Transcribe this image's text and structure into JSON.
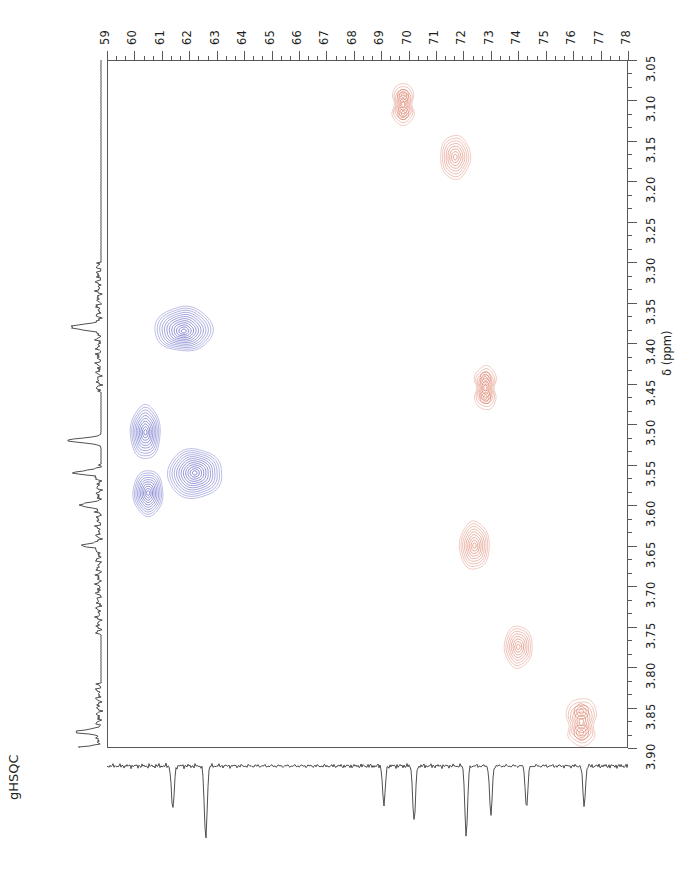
{
  "experiment": {
    "label": "gHSQC",
    "type": "2D HSQC NMR spectrum"
  },
  "axes": {
    "carbon": {
      "position": "top",
      "nucleus": "13C",
      "unit": "ppm",
      "min": 59,
      "max": 78,
      "direction": "increasing-left-to-right",
      "tick_labels": [
        "59",
        "60",
        "61",
        "62",
        "63",
        "64",
        "65",
        "66",
        "67",
        "68",
        "69",
        "70",
        "71",
        "72",
        "73",
        "74",
        "75",
        "76",
        "77",
        "78"
      ],
      "minor_ticks_per_major": 2
    },
    "proton": {
      "position": "right",
      "nucleus": "1H",
      "unit": "ppm",
      "min": 3.05,
      "max": 3.9,
      "direction": "increasing-top-to-bottom",
      "title": "δ (ppm)",
      "tick_labels": [
        "3.05",
        "3.10",
        "3.15",
        "3.20",
        "3.25",
        "3.30",
        "3.35",
        "3.40",
        "3.45",
        "3.50",
        "3.55",
        "3.60",
        "3.65",
        "3.70",
        "3.75",
        "3.80",
        "3.85",
        "3.90"
      ],
      "minor_ticks_per_major": 2
    }
  },
  "colors": {
    "positive_contour": "#d9735a",
    "negative_contour": "#5357bf",
    "axis": "#58585a",
    "trace": "#3c3c3c",
    "background": "#ffffff",
    "text": "#231f20"
  },
  "chart_data": {
    "type": "scatter",
    "title": "",
    "xlabel": "13C δ (ppm)",
    "ylabel": "1H δ (ppm)",
    "xlim": [
      59,
      78
    ],
    "ylim": [
      3.05,
      3.9
    ],
    "grid": false,
    "legend": "none",
    "series": [
      {
        "name": "positive (CH / CH3)",
        "color": "#d9735a",
        "sign": "positive",
        "points": [
          {
            "label": "A",
            "c_ppm": 69.8,
            "h_ppm": 3.105,
            "shape": "split-doublet",
            "rings": 7,
            "w": 26,
            "h": 42
          },
          {
            "label": "B",
            "c_ppm": 71.7,
            "h_ppm": 3.17,
            "shape": "oval",
            "rings": 8,
            "w": 30,
            "h": 44
          },
          {
            "label": "C",
            "c_ppm": 72.8,
            "h_ppm": 3.455,
            "shape": "split-doublet",
            "rings": 7,
            "w": 26,
            "h": 44
          },
          {
            "label": "D",
            "c_ppm": 72.4,
            "h_ppm": 3.65,
            "shape": "oval",
            "rings": 9,
            "w": 30,
            "h": 48
          },
          {
            "label": "E",
            "c_ppm": 74.0,
            "h_ppm": 3.775,
            "shape": "oval",
            "rings": 8,
            "w": 28,
            "h": 42
          },
          {
            "label": "F",
            "c_ppm": 76.3,
            "h_ppm": 3.868,
            "shape": "multi-lobe",
            "rings": 7,
            "w": 34,
            "h": 50
          }
        ]
      },
      {
        "name": "negative (CH2)",
        "color": "#5357bf",
        "sign": "negative",
        "points": [
          {
            "label": "G",
            "c_ppm": 61.8,
            "h_ppm": 3.385,
            "shape": "broad-flat",
            "rings": 12,
            "w": 56,
            "h": 50
          },
          {
            "label": "H",
            "c_ppm": 60.4,
            "h_ppm": 3.51,
            "shape": "oval",
            "rings": 10,
            "w": 30,
            "h": 54
          },
          {
            "label": "I",
            "c_ppm": 62.2,
            "h_ppm": 3.56,
            "shape": "broad-round",
            "rings": 12,
            "w": 54,
            "h": 48
          },
          {
            "label": "J",
            "c_ppm": 60.5,
            "h_ppm": 3.585,
            "shape": "oval",
            "rings": 10,
            "w": 30,
            "h": 46
          }
        ]
      }
    ],
    "projections": {
      "proton_1d": {
        "side": "left",
        "direction": "peaks-point-left",
        "peaks_h_ppm": [
          3.38,
          3.52,
          3.56,
          3.6,
          3.65,
          3.88,
          3.9
        ],
        "noisy_regions": [
          "3.30-3.45",
          "3.55-3.75",
          "3.82-3.90"
        ]
      },
      "carbon_1d": {
        "side": "bottom",
        "direction": "peaks-point-down",
        "peaks_c_ppm": [
          61.4,
          62.6,
          69.1,
          70.2,
          72.1,
          73.0,
          74.3,
          76.4
        ],
        "baseline_noise": true
      }
    }
  }
}
